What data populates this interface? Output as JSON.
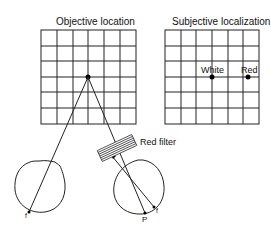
{
  "titles": {
    "objective": "Objective location",
    "subjective": "Subjective localization"
  },
  "labels": {
    "white": "White",
    "red": "Red",
    "red_filter": "Red filter",
    "fovea_left": "f",
    "fovea_right": "f",
    "point_p": "P"
  },
  "grids": {
    "rows": 6,
    "cols": 6
  }
}
